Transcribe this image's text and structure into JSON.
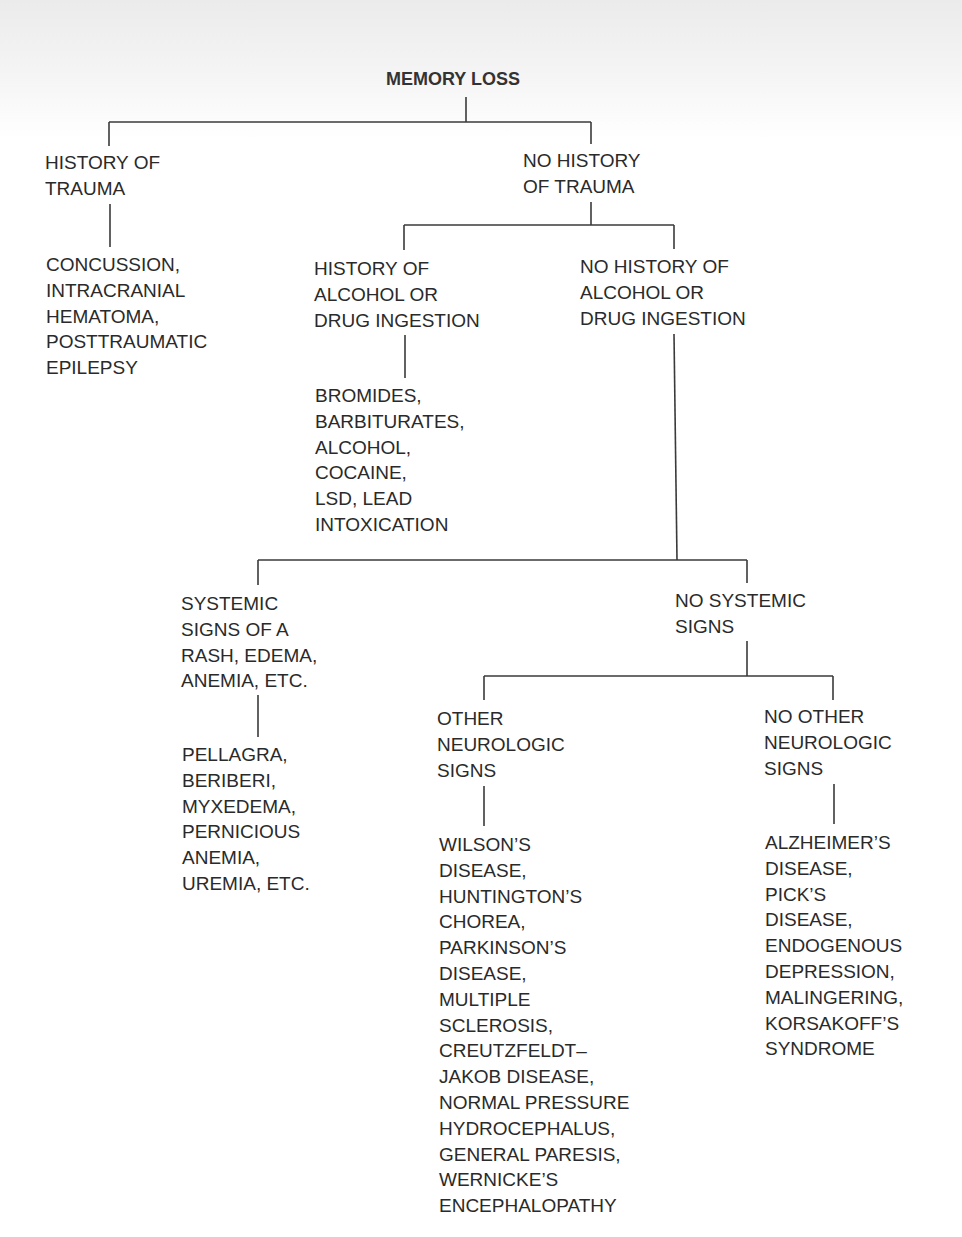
{
  "diagram": {
    "title": "MEMORY LOSS",
    "nodes": {
      "history_trauma": "HISTORY OF\nTRAUMA",
      "no_history_trauma": "NO HISTORY\nOF TRAUMA",
      "trauma_causes": "CONCUSSION,\nINTRACRANIAL\nHEMATOMA,\nPOSTTRAUMATIC\nEPILEPSY",
      "history_alcohol": "HISTORY OF\nALCOHOL OR\nDRUG INGESTION",
      "no_history_alcohol": "NO HISTORY OF\nALCOHOL OR\nDRUG INGESTION",
      "alcohol_causes": "BROMIDES,\nBARBITURATES,\nALCOHOL,\nCOCAINE,\nLSD, LEAD\nINTOXICATION",
      "systemic_signs": "SYSTEMIC\nSIGNS OF A\nRASH, EDEMA,\nANEMIA, ETC.",
      "no_systemic_signs": "NO SYSTEMIC\nSIGNS",
      "systemic_causes": "PELLAGRA,\nBERIBERI,\nMYXEDEMA,\nPERNICIOUS\nANEMIA,\nUREMIA, ETC.",
      "other_neuro": "OTHER\nNEUROLOGIC\nSIGNS",
      "no_other_neuro": "NO OTHER\nNEUROLOGIC\nSIGNS",
      "neuro_causes": "WILSON’S\nDISEASE,\nHUNTINGTON’S\nCHOREA,\nPARKINSON’S\nDISEASE,\nMULTIPLE\nSCLEROSIS,\nCREUTZFELDT–\nJAKOB DISEASE,\nNORMAL PRESSURE\nHYDROCEPHALUS,\nGENERAL PARESIS,\nWERNICKE’S\nENCEPHALOPATHY",
      "no_neuro_causes": "ALZHEIMER’S\nDISEASE,\nPICK’S\nDISEASE,\nENDOGENOUS\nDEPRESSION,\nMALINGERING,\nKORSAKOFF’S\nSYNDROME"
    },
    "colors": {
      "line": "#3a3a3a",
      "text": "#2a2a2a"
    }
  }
}
